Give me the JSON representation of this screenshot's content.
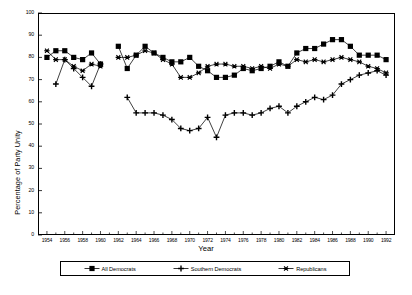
{
  "chart_data": {
    "type": "line",
    "title": "",
    "xlabel": "Year",
    "ylabel": "Percentage of Party Unity",
    "xlim": [
      1953,
      1993
    ],
    "ylim": [
      0,
      100
    ],
    "ytick_step": 10,
    "xtick_step": 2,
    "grid": false,
    "legend_position": "bottom",
    "yticks": [
      "0",
      "10",
      "20",
      "30",
      "40",
      "50",
      "60",
      "70",
      "80",
      "90",
      "100"
    ],
    "xticks": [
      "1954",
      "1956",
      "1958",
      "1960",
      "1962",
      "1964",
      "1966",
      "1968",
      "1970",
      "1972",
      "1974",
      "1976",
      "1978",
      "1980",
      "1982",
      "1984",
      "1986",
      "1988",
      "1990",
      "1992"
    ],
    "series": [
      {
        "name": "All Democrats",
        "marker": "filled-square",
        "x": [
          1954,
          1955,
          1956,
          1957,
          1958,
          1959,
          1960,
          1962,
          1963,
          1964,
          1965,
          1966,
          1967,
          1968,
          1969,
          1970,
          1971,
          1972,
          1973,
          1974,
          1975,
          1976,
          1977,
          1978,
          1979,
          1980,
          1981,
          1982,
          1983,
          1984,
          1985,
          1986,
          1987,
          1988,
          1989,
          1990,
          1991,
          1992
        ],
        "values": [
          80,
          83,
          83,
          80,
          79,
          82,
          77,
          85,
          75,
          81,
          85,
          82,
          80,
          78,
          78,
          80,
          76,
          74,
          71,
          71,
          72,
          75,
          74,
          75,
          76,
          78,
          76,
          82,
          84,
          84,
          86,
          88,
          88,
          85,
          81,
          81,
          81,
          79
        ]
      },
      {
        "name": "Southern Democrats",
        "marker": "plus",
        "x": [
          1955,
          1956,
          1957,
          1958,
          1959,
          1960,
          1963,
          1964,
          1965,
          1966,
          1967,
          1968,
          1969,
          1970,
          1971,
          1972,
          1973,
          1974,
          1975,
          1976,
          1977,
          1978,
          1979,
          1980,
          1981,
          1982,
          1983,
          1984,
          1985,
          1986,
          1987,
          1988,
          1989,
          1990,
          1991,
          1992
        ],
        "values": [
          68,
          79,
          75,
          71,
          67,
          77,
          62,
          55,
          55,
          55,
          54,
          52,
          48,
          47,
          48,
          53,
          44,
          54,
          55,
          55,
          54,
          55,
          57,
          58,
          55,
          58,
          60,
          62,
          61,
          63,
          68,
          70,
          72,
          73,
          74,
          72
        ]
      },
      {
        "name": "Republicans",
        "marker": "star",
        "x": [
          1954,
          1955,
          1956,
          1957,
          1958,
          1959,
          1960,
          1962,
          1963,
          1964,
          1965,
          1966,
          1967,
          1968,
          1969,
          1970,
          1971,
          1972,
          1973,
          1974,
          1975,
          1976,
          1977,
          1978,
          1979,
          1980,
          1981,
          1982,
          1983,
          1984,
          1985,
          1986,
          1987,
          1988,
          1989,
          1990,
          1991,
          1992
        ],
        "values": [
          83,
          79,
          79,
          76,
          74,
          77,
          76,
          80,
          80,
          81,
          83,
          82,
          79,
          77,
          71,
          71,
          73,
          76,
          77,
          77,
          76,
          76,
          75,
          76,
          75,
          77,
          76,
          79,
          78,
          79,
          78,
          79,
          80,
          79,
          78,
          76,
          75,
          73
        ]
      }
    ],
    "legend": [
      {
        "label": "All Democrats",
        "marker": "filled-square"
      },
      {
        "label": "Southern Democrats",
        "marker": "plus"
      },
      {
        "label": "Republicans",
        "marker": "star"
      }
    ]
  }
}
